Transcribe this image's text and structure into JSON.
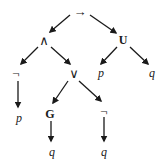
{
  "diagram": {
    "type": "syntax-tree",
    "nodes": [
      {
        "id": "n0",
        "label": "→",
        "style": "op",
        "x": 80,
        "y": 11
      },
      {
        "id": "n1",
        "label": "∧",
        "style": "op",
        "x": 44,
        "y": 40
      },
      {
        "id": "n2",
        "label": "U",
        "style": "bold",
        "x": 123,
        "y": 40
      },
      {
        "id": "n3",
        "label": "¬",
        "style": "op",
        "x": 16,
        "y": 73
      },
      {
        "id": "n4",
        "label": "∨",
        "style": "op",
        "x": 74,
        "y": 73
      },
      {
        "id": "n5",
        "label": "p",
        "style": "italic",
        "x": 101,
        "y": 73
      },
      {
        "id": "n6",
        "label": "q",
        "style": "italic",
        "x": 152,
        "y": 73
      },
      {
        "id": "n7",
        "label": "p",
        "style": "italic",
        "x": 19,
        "y": 118
      },
      {
        "id": "n8",
        "label": "G",
        "style": "bold",
        "x": 50,
        "y": 114
      },
      {
        "id": "n9",
        "label": "¬",
        "style": "op",
        "x": 104,
        "y": 111
      },
      {
        "id": "n10",
        "label": "q",
        "style": "italic",
        "x": 52,
        "y": 152
      },
      {
        "id": "n11",
        "label": "q",
        "style": "italic",
        "x": 104,
        "y": 152
      }
    ],
    "edges": [
      {
        "from": "n0",
        "to": "n1",
        "x1": 70,
        "y1": 15,
        "x2": 50,
        "y2": 32
      },
      {
        "from": "n0",
        "to": "n2",
        "x1": 90,
        "y1": 15,
        "x2": 116,
        "y2": 33
      },
      {
        "from": "n1",
        "to": "n3",
        "x1": 38,
        "y1": 47,
        "x2": 21,
        "y2": 64
      },
      {
        "from": "n1",
        "to": "n4",
        "x1": 51,
        "y1": 47,
        "x2": 70,
        "y2": 64
      },
      {
        "from": "n2",
        "to": "n5",
        "x1": 117,
        "y1": 47,
        "x2": 101,
        "y2": 64
      },
      {
        "from": "n2",
        "to": "n6",
        "x1": 130,
        "y1": 47,
        "x2": 148,
        "y2": 64
      },
      {
        "from": "n3",
        "to": "n7",
        "x1": 18,
        "y1": 81,
        "x2": 18,
        "y2": 107
      },
      {
        "from": "n4",
        "to": "n8",
        "x1": 68,
        "y1": 81,
        "x2": 53,
        "y2": 103
      },
      {
        "from": "n4",
        "to": "n9",
        "x1": 79,
        "y1": 81,
        "x2": 101,
        "y2": 101
      },
      {
        "from": "n8",
        "to": "n10",
        "x1": 51,
        "y1": 121,
        "x2": 51,
        "y2": 141
      },
      {
        "from": "n9",
        "to": "n11",
        "x1": 104,
        "y1": 117,
        "x2": 104,
        "y2": 141
      }
    ]
  }
}
